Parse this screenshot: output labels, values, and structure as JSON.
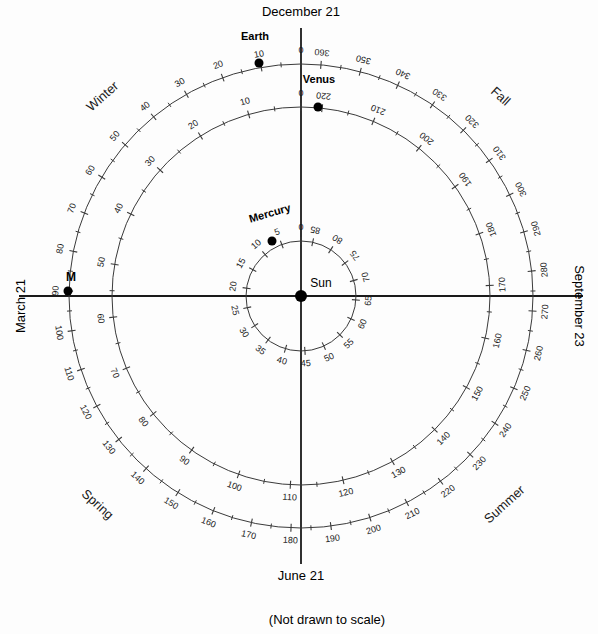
{
  "figure": {
    "caption": "(Not drawn to scale)",
    "background_color": "#fdfdfd",
    "line_color": "#3a3a3a",
    "axis_color": "#1a1a1a",
    "dot_color": "#000000"
  },
  "center": {
    "label": "Sun",
    "x": 301,
    "y": 296,
    "dot_radius": 6
  },
  "axes": {
    "vertical": {
      "top_label": "December 21",
      "bottom_label": "June 21"
    },
    "horizontal": {
      "left_label": "March 21",
      "right_label": "September 23"
    }
  },
  "seasons": [
    {
      "name": "Winter",
      "x": 103,
      "y": 97,
      "rotate": -42
    },
    {
      "name": "Fall",
      "x": 500,
      "y": 97,
      "rotate": 42
    },
    {
      "name": "Spring",
      "x": 97,
      "y": 505,
      "rotate": 42
    },
    {
      "name": "Summer",
      "x": 505,
      "y": 505,
      "rotate": -42
    }
  ],
  "markers": [
    {
      "label": "M",
      "orbit": "Earth",
      "value": 80,
      "x": 68,
      "y": 291
    }
  ],
  "chart_data": {
    "type": "polar-scatter",
    "subtitle": "(Not drawn to scale)",
    "angle_convention": "Day 0 at top (December 21 direction for Earth); values increase clockwise as seen on page is false — values increase counter-clockwise to the left of top and wrap at period end to the right of top.",
    "orbits": [
      {
        "name": "Earth",
        "radius_px": 232,
        "period_days": 365,
        "tick_major_step": 10,
        "tick_minor_step": 5,
        "label_step": 10,
        "start_label": "0",
        "end_label": "360",
        "axis_values": {
          "top": 0,
          "left": 80,
          "bottom": 175,
          "right": 270
        },
        "body": {
          "label": "Earth",
          "value": 0,
          "x": 259,
          "y": 63
        }
      },
      {
        "name": "Venus",
        "radius_px": 189,
        "period_days": 224,
        "tick_major_step": 10,
        "tick_minor_step": 5,
        "label_step": 10,
        "start_label": "0",
        "end_label": "220",
        "axis_values": {
          "top": 0,
          "left": 60,
          "bottom": 115,
          "right": 170
        },
        "body": {
          "label": "Venus",
          "value": 0,
          "x": 318,
          "y": 107
        }
      },
      {
        "name": "Mercury",
        "radius_px": 55,
        "period_days": 88,
        "tick_major_step": 5,
        "tick_minor_step": 5,
        "label_step": 5,
        "start_label": "0",
        "end_label": "85",
        "axis_values": {
          "top": 0,
          "left": 20,
          "bottom": 42,
          "right": 65
        },
        "body": {
          "label": "Mercury",
          "value": 0,
          "x": 272,
          "y": 241
        }
      }
    ],
    "earth_tick_labels": [
      0,
      10,
      20,
      30,
      40,
      50,
      60,
      70,
      80,
      90,
      100,
      110,
      120,
      130,
      140,
      150,
      160,
      170,
      180,
      190,
      200,
      210,
      220,
      230,
      240,
      250,
      260,
      270,
      280,
      290,
      300,
      310,
      320,
      330,
      340,
      350,
      360
    ],
    "venus_tick_labels": [
      0,
      10,
      20,
      30,
      40,
      50,
      60,
      70,
      80,
      90,
      100,
      110,
      120,
      130,
      140,
      150,
      160,
      170,
      180,
      190,
      200,
      210,
      220
    ],
    "mercury_tick_labels": [
      0,
      5,
      10,
      15,
      20,
      25,
      30,
      35,
      40,
      45,
      50,
      55,
      60,
      65,
      70,
      75,
      80,
      85
    ]
  }
}
